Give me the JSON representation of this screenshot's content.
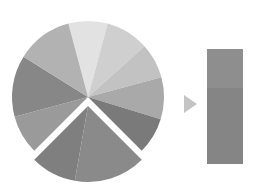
{
  "diagram": {
    "pie": {
      "cx": 88,
      "cy": 97,
      "r": 76,
      "slices": [
        {
          "start": -105,
          "end": -75,
          "color": "#e2e2e2"
        },
        {
          "start": -75,
          "end": -42,
          "color": "#cfcfcf"
        },
        {
          "start": -42,
          "end": -15,
          "color": "#c2c2c2"
        },
        {
          "start": -15,
          "end": 17,
          "color": "#a9a9a9"
        },
        {
          "start": 17,
          "end": 45,
          "color": "#7a7a7a"
        },
        {
          "start": 135,
          "end": 165,
          "color": "#9a9a9a"
        },
        {
          "start": 165,
          "end": 212,
          "color": "#878787"
        },
        {
          "start": 212,
          "end": 255,
          "color": "#b2b2b2"
        }
      ],
      "exploded": {
        "offset": 9,
        "slices": [
          {
            "start": 45,
            "end": 100,
            "color": "#8a8a8a"
          },
          {
            "start": 100,
            "end": 135,
            "color": "#7f7f7f"
          }
        ]
      }
    },
    "arrow": {
      "color": "#c4c4c4"
    },
    "bar": {
      "x": 207,
      "y": 49,
      "w": 36,
      "h": 115,
      "segments": [
        {
          "h": 39,
          "color": "#8e8e8e"
        },
        {
          "h": 76,
          "color": "#858585"
        }
      ]
    }
  }
}
